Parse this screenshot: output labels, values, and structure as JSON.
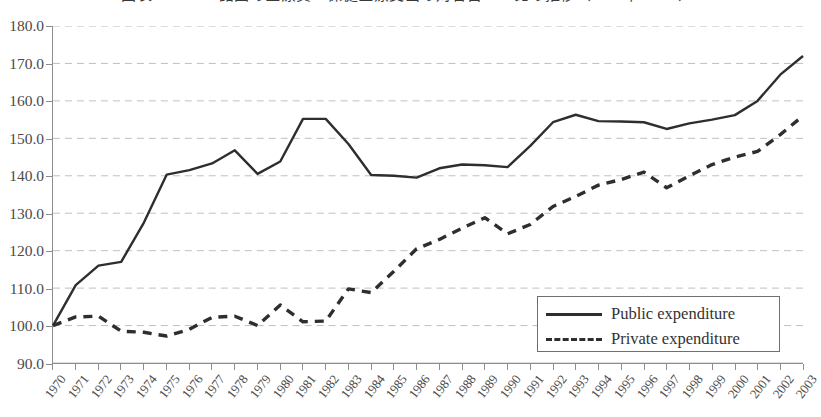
{
  "figure": {
    "title": "図表2　OECD諸国の医療費・保健医療支出の対名目GDP比の推移（1970年＝100）"
  },
  "legend": {
    "position": "bottom-right",
    "items": [
      {
        "label": "Public expenditure",
        "style": "solid"
      },
      {
        "label": "Private expenditure",
        "style": "dashed"
      }
    ]
  },
  "chart_data": {
    "type": "line",
    "title": "図表2　OECD諸国の医療費・保健医療支出の対名目GDP比の推移（1970年＝100）",
    "xlabel": "",
    "ylabel": "",
    "grid": true,
    "ylim": [
      90.0,
      180.0
    ],
    "ytick_step": 10.0,
    "ytick_labels": [
      "90.0",
      "100.0",
      "110.0",
      "120.0",
      "130.0",
      "140.0",
      "150.0",
      "160.0",
      "170.0",
      "180.0"
    ],
    "categories": [
      "1970",
      "1971",
      "1972",
      "1973",
      "1974",
      "1975",
      "1976",
      "1977",
      "1978",
      "1979",
      "1980",
      "1981",
      "1982",
      "1983",
      "1984",
      "1985",
      "1986",
      "1987",
      "1988",
      "1989",
      "1990",
      "1991",
      "1992",
      "1993",
      "1994",
      "1995",
      "1996",
      "1997",
      "1998",
      "1999",
      "2000",
      "2001",
      "2002",
      "2003"
    ],
    "series": [
      {
        "name": "Public expenditure",
        "style": "solid",
        "color": "#2e2e2e",
        "values": [
          100.0,
          110.8,
          116.0,
          117.0,
          127.5,
          140.3,
          141.5,
          143.3,
          146.8,
          140.5,
          143.8,
          155.2,
          155.2,
          148.5,
          140.2,
          140.0,
          139.5,
          142.0,
          143.0,
          142.8,
          142.3,
          148.0,
          154.3,
          156.3,
          154.6,
          154.5,
          154.3,
          152.5,
          154.0,
          155.0,
          156.2,
          160.0,
          167.0,
          172.0
        ]
      },
      {
        "name": "Private expenditure",
        "style": "dashed",
        "color": "#2e2e2e",
        "values": [
          100.0,
          102.3,
          102.5,
          98.5,
          98.2,
          97.2,
          99.0,
          102.2,
          102.5,
          100.0,
          105.5,
          101.0,
          101.2,
          109.8,
          108.8,
          114.5,
          120.5,
          123.0,
          126.0,
          128.8,
          124.5,
          127.0,
          131.8,
          134.5,
          137.5,
          139.0,
          141.0,
          136.8,
          140.0,
          143.0,
          145.0,
          146.5,
          151.0,
          156.0
        ]
      }
    ]
  }
}
